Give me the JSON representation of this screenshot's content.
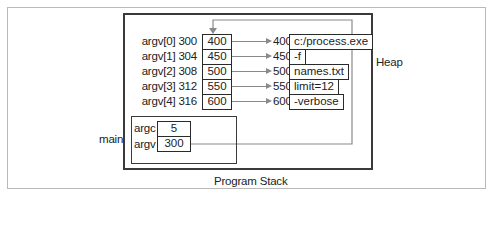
{
  "diagram": {
    "labels": {
      "heap": "Heap",
      "main": "main",
      "program_stack": "Program Stack"
    },
    "argv_array": [
      {
        "label": "argv[0] 300",
        "value": "400",
        "target_addr": "400",
        "string": "c:/process.exe"
      },
      {
        "label": "argv[1] 304",
        "value": "450",
        "target_addr": "450",
        "string": "-f"
      },
      {
        "label": "argv[2] 308",
        "value": "500",
        "target_addr": "500",
        "string": "names.txt"
      },
      {
        "label": "argv[3] 312",
        "value": "550",
        "target_addr": "550",
        "string": "limit=12"
      },
      {
        "label": "argv[4] 316",
        "value": "600",
        "target_addr": "600",
        "string": "-verbose"
      }
    ],
    "main_frame": {
      "argc": {
        "label": "argc",
        "value": "5"
      },
      "argv": {
        "label": "argv",
        "value": "300"
      }
    },
    "colors": {
      "box_border": "#2a2a2a",
      "frame_border": "#b9b9b9",
      "arrow": "#8a8a8a"
    }
  }
}
